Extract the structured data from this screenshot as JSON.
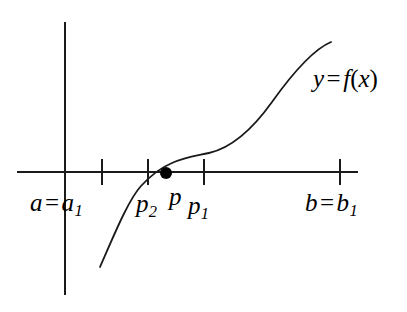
{
  "figure": {
    "background_color": "#ffffff",
    "stroke_color": "#1a1a1a",
    "width": 407,
    "height": 312
  },
  "axes": {
    "x_axis": {
      "y": 172,
      "x_start": 17,
      "x_end": 358
    },
    "y_axis": {
      "x": 65,
      "y_start": 22,
      "y_end": 295
    },
    "tick_half_length": 13
  },
  "ticks": [
    {
      "name": "a1",
      "x": 102
    },
    {
      "name": "p2",
      "x": 148
    },
    {
      "name": "p1",
      "x": 204
    },
    {
      "name": "b1",
      "x": 340
    }
  ],
  "root_point": {
    "label": "p",
    "x": 166,
    "y": 173,
    "radius": 6,
    "fill": "#000000"
  },
  "curve": {
    "description": "increasing cubic-like S curve crossing the x-axis near p",
    "path": "M 100 267 C 112 240 128 200 141 186 C 152 174 160 168 172 163 C 186 157 196 156 209 153 C 231 148 252 130 272 102 C 292 74 312 50 331 42"
  },
  "labels": {
    "a_label": {
      "base": "a",
      "relation": "=",
      "sub_base": "a",
      "subscript": "1",
      "text": "a = a₁"
    },
    "p2_label": {
      "base": "p",
      "subscript": "2",
      "text": "p₂"
    },
    "p_label": {
      "base": "p",
      "text": "p"
    },
    "p1_label": {
      "base": "p",
      "subscript": "1",
      "text": "p₁"
    },
    "b_label": {
      "base": "b",
      "relation": "=",
      "sub_base": "b",
      "subscript": "1",
      "text": "b = b₁"
    },
    "function_label": {
      "variable": "y",
      "relation": "=",
      "function": "f",
      "open": "(",
      "argument": "x",
      "close": ")",
      "text": "y = f(x)"
    }
  }
}
